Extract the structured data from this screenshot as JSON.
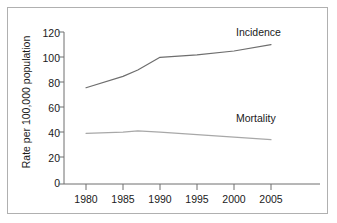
{
  "chart_data": {
    "type": "line",
    "title": "",
    "xlabel": "",
    "ylabel": "Rate per 100,000 population",
    "xlim": [
      1978,
      2007
    ],
    "ylim": [
      0,
      120
    ],
    "grid": false,
    "legend_position": "inline-right",
    "x_ticks": [
      "1980",
      "1985",
      "1990",
      "1995",
      "2000",
      "2005"
    ],
    "x_tick_values": [
      1980,
      1985,
      1990,
      1995,
      2000,
      2005
    ],
    "y_ticks": [
      "0",
      "20",
      "40",
      "60",
      "80",
      "100",
      "120"
    ],
    "y_tick_values": [
      0,
      20,
      40,
      60,
      80,
      100,
      120
    ],
    "x": [
      1980,
      1985,
      1987,
      1990,
      1995,
      2000,
      2005
    ],
    "series": [
      {
        "name": "Incidence",
        "label": "Incidence",
        "color": "#6e6e6e",
        "values": [
          76,
          85,
          90,
          100,
          102,
          105,
          110
        ]
      },
      {
        "name": "Mortality",
        "label": "Mortality",
        "color": "#a8a8a8",
        "values": [
          40,
          41,
          42,
          41,
          39,
          37,
          35
        ]
      }
    ],
    "annotations": [
      {
        "text": "Incidence",
        "x": 2001,
        "y": 117
      },
      {
        "text": "Mortality",
        "x": 2001,
        "y": 49
      }
    ]
  },
  "style": {
    "axis_color": "#6e6e6e",
    "frame_color": "#b0b0b0",
    "background": "#ffffff",
    "text_color": "#1a1a1a"
  }
}
